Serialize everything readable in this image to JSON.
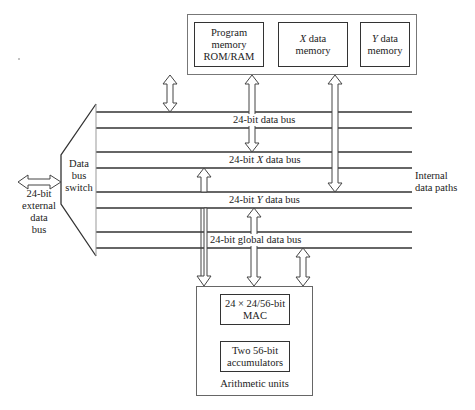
{
  "memory_block": {
    "program_memory": {
      "line1": "Program",
      "line2": "memory",
      "line3": "ROM/RAM"
    },
    "x_data_memory": {
      "var": "X",
      "line1_rest": " data",
      "line2": "memory"
    },
    "y_data_memory": {
      "var": "Y",
      "line1_rest": " data",
      "line2": "memory"
    }
  },
  "buses": [
    {
      "pre": "24-bit ",
      "var": "",
      "post": "data bus"
    },
    {
      "pre": "24-bit ",
      "var": "X",
      "post": " data bus"
    },
    {
      "pre": "24-bit ",
      "var": "Y",
      "post": " data bus"
    },
    {
      "pre": "24-bit ",
      "var": "",
      "post": "global data bus"
    }
  ],
  "switch": {
    "line1": "Data",
    "line2": "bus",
    "line3": "switch"
  },
  "external": {
    "line1": "24-bit",
    "line2": "external",
    "line3": "data",
    "line4": "bus"
  },
  "internal_paths": {
    "line1": "Internal",
    "line2": "data paths"
  },
  "arithmetic": {
    "mac": {
      "line1": "24 × 24/56-bit",
      "line2": "MAC"
    },
    "accumulators": {
      "line1": "Two 56-bit",
      "line2": "accumulators"
    },
    "label": "Arithmetic units"
  }
}
